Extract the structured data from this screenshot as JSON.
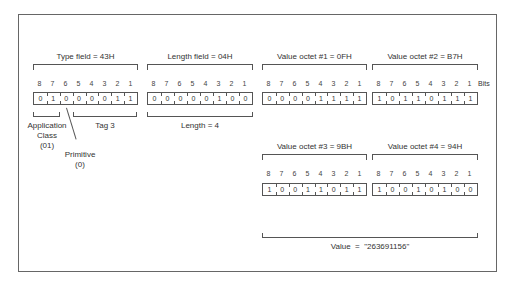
{
  "diagram": {
    "bits_header": [
      "8",
      "7",
      "6",
      "5",
      "4",
      "3",
      "2",
      "1"
    ],
    "bits_suffix": "Bits",
    "fields": [
      {
        "title": "Type field = 43H",
        "bits": [
          "0",
          "1",
          "0",
          "0",
          "0",
          "0",
          "1",
          "1"
        ]
      },
      {
        "title": "Length field = 04H",
        "bits": [
          "0",
          "0",
          "0",
          "0",
          "0",
          "1",
          "0",
          "0"
        ]
      },
      {
        "title": "Value octet #1 = 0FH",
        "bits": [
          "0",
          "0",
          "0",
          "0",
          "1",
          "1",
          "1",
          "1"
        ]
      },
      {
        "title": "Value octet #2 = B7H",
        "bits": [
          "1",
          "0",
          "1",
          "1",
          "0",
          "1",
          "1",
          "1"
        ]
      },
      {
        "title": "Value octet #3 = 9BH",
        "bits": [
          "1",
          "0",
          "0",
          "1",
          "1",
          "0",
          "1",
          "1"
        ]
      },
      {
        "title": "Value octet #4 = 94H",
        "bits": [
          "1",
          "0",
          "0",
          "1",
          "0",
          "1",
          "0",
          "0"
        ]
      }
    ],
    "annotations": {
      "application_class": "Application",
      "application_class_2": "Class",
      "application_class_value": "(01)",
      "primitive": "Primitive",
      "primitive_value": "(0)",
      "tag": "Tag 3",
      "length": "Length = 4",
      "value": "Value  =  \"263691156\""
    }
  }
}
